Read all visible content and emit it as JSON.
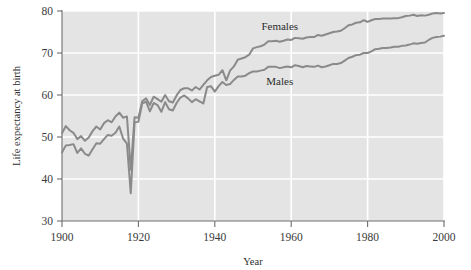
{
  "chart_data": {
    "type": "line",
    "title": "",
    "xlabel": "Year",
    "ylabel": "Life expectancy at birth",
    "xlim": [
      1900,
      2000
    ],
    "ylim": [
      30,
      80
    ],
    "xticks": [
      1900,
      1920,
      1940,
      1960,
      1980,
      2000
    ],
    "xtick_labels": [
      "1900",
      "1920",
      "1940",
      "1960",
      "1980",
      "2000"
    ],
    "yticks": [
      30,
      40,
      50,
      60,
      70,
      80
    ],
    "ytick_labels": [
      "30",
      "40",
      "50",
      "60",
      "70",
      "80"
    ],
    "grid": true,
    "grid_color": "#ffffff",
    "plot_background": "#e4e4e4",
    "legend_position": "inline-annotation",
    "line_color": "#8a8a8a",
    "x": [
      1900,
      1901,
      1902,
      1903,
      1904,
      1905,
      1906,
      1907,
      1908,
      1909,
      1910,
      1911,
      1912,
      1913,
      1914,
      1915,
      1916,
      1917,
      1918,
      1919,
      1920,
      1921,
      1922,
      1923,
      1924,
      1925,
      1926,
      1927,
      1928,
      1929,
      1930,
      1931,
      1932,
      1933,
      1934,
      1935,
      1936,
      1937,
      1938,
      1939,
      1940,
      1941,
      1942,
      1943,
      1944,
      1945,
      1946,
      1947,
      1948,
      1949,
      1950,
      1951,
      1952,
      1953,
      1954,
      1955,
      1956,
      1957,
      1958,
      1959,
      1960,
      1961,
      1962,
      1963,
      1964,
      1965,
      1966,
      1967,
      1968,
      1969,
      1970,
      1971,
      1972,
      1973,
      1974,
      1975,
      1976,
      1977,
      1978,
      1979,
      1980,
      1981,
      1982,
      1983,
      1984,
      1985,
      1986,
      1987,
      1988,
      1989,
      1990,
      1991,
      1992,
      1993,
      1994,
      1995,
      1996,
      1997,
      1998,
      1999,
      2000
    ],
    "series": [
      {
        "name": "Females",
        "label": "Females",
        "label_x": 1957,
        "label_y": 75.5,
        "color": "#8a8a8a",
        "values": [
          50.9,
          52.6,
          51.6,
          51.0,
          49.5,
          50.2,
          49.1,
          49.9,
          51.4,
          52.5,
          51.8,
          53.3,
          54.0,
          53.5,
          54.9,
          55.8,
          54.6,
          54.9,
          42.2,
          54.7,
          54.6,
          58.5,
          59.2,
          57.6,
          59.6,
          59.0,
          58.4,
          60.0,
          58.5,
          58.2,
          59.9,
          61.2,
          61.6,
          61.6,
          61.1,
          61.9,
          61.3,
          62.4,
          63.5,
          64.3,
          64.6,
          64.8,
          65.9,
          63.5,
          65.8,
          66.8,
          68.4,
          68.7,
          69.0,
          69.6,
          71.1,
          71.4,
          71.6,
          72.0,
          72.8,
          72.8,
          72.9,
          72.7,
          72.9,
          73.2,
          73.1,
          73.6,
          73.5,
          73.4,
          73.7,
          73.8,
          73.8,
          74.3,
          74.1,
          74.4,
          74.7,
          75.0,
          75.1,
          75.3,
          75.9,
          76.6,
          76.8,
          77.2,
          77.3,
          77.8,
          77.4,
          77.8,
          78.1,
          78.1,
          78.2,
          78.2,
          78.2,
          78.3,
          78.3,
          78.5,
          78.8,
          78.9,
          79.1,
          78.8,
          79.0,
          78.9,
          79.1,
          79.4,
          79.5,
          79.4,
          79.5
        ]
      },
      {
        "name": "Males",
        "label": "Males",
        "label_x": 1957,
        "label_y": 62.5,
        "color": "#8a8a8a",
        "values": [
          46.3,
          48.0,
          48.1,
          48.3,
          46.2,
          47.3,
          46.0,
          45.6,
          47.1,
          48.5,
          48.4,
          49.5,
          50.5,
          50.3,
          51.0,
          52.5,
          49.6,
          48.4,
          36.6,
          53.5,
          53.6,
          58.0,
          58.4,
          56.1,
          58.1,
          57.6,
          56.0,
          58.3,
          56.6,
          56.3,
          58.1,
          59.4,
          59.9,
          59.2,
          58.3,
          59.0,
          58.5,
          58.0,
          61.9,
          62.1,
          60.8,
          62.1,
          63.1,
          62.4,
          62.6,
          63.6,
          64.4,
          64.4,
          64.6,
          65.2,
          65.6,
          65.6,
          65.8,
          66.0,
          66.7,
          66.7,
          66.7,
          66.4,
          66.6,
          66.8,
          66.6,
          67.1,
          66.9,
          66.6,
          66.9,
          66.8,
          66.7,
          67.0,
          66.6,
          66.8,
          67.1,
          67.4,
          67.4,
          67.6,
          68.2,
          68.8,
          69.1,
          69.5,
          69.6,
          70.0,
          70.0,
          70.4,
          70.9,
          71.0,
          71.2,
          71.2,
          71.3,
          71.5,
          71.5,
          71.7,
          71.8,
          72.0,
          72.3,
          72.2,
          72.4,
          72.5,
          73.1,
          73.6,
          73.8,
          73.9,
          74.1
        ]
      }
    ]
  },
  "axes": {
    "x_title": "Year",
    "y_title": "Life expectancy at birth"
  }
}
